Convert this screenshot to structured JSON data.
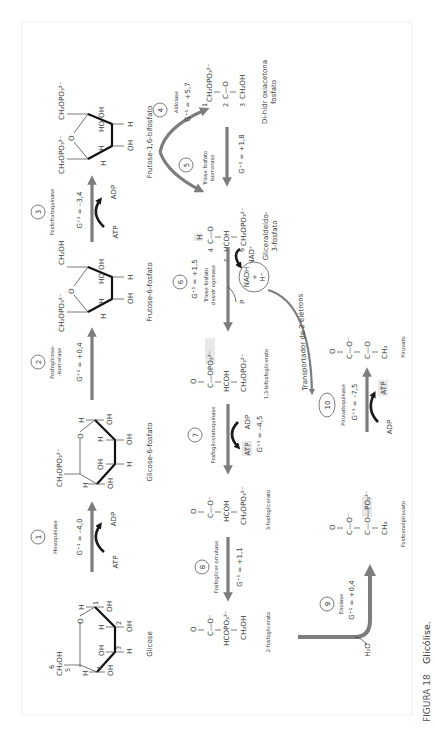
{
  "figure": {
    "caption_number": "FIGURA 18",
    "caption_title": "Glicólise.",
    "orientation": "rotated 90° counter-clockwise"
  },
  "colors": {
    "main_arrow": "#7d7d7d",
    "cofactor_arrow": "#1a1a1a",
    "text": "#3a3a3a",
    "frame_border": "#f0f0f0"
  },
  "steps": [
    {
      "number": "1",
      "enzyme": "Hexoquinase",
      "dg": "G⁺¹ = –4,0",
      "cofactor_in": "ATP",
      "cofactor_out": "ADP"
    },
    {
      "number": "2",
      "enzyme_line1": "Fosfoglicose-",
      "enzyme_line2": "-isomerase",
      "dg": "G⁺¹ = +0,4"
    },
    {
      "number": "3",
      "enzyme": "Fosfofrutoquinase",
      "dg": "G⁺¹ = –3,4",
      "cofactor_in": "ATP",
      "cofactor_out": "ADP"
    },
    {
      "number": "4",
      "enzyme": "Aldolase",
      "dg": "G⁺¹ = +5,7"
    },
    {
      "number": "5",
      "enzyme_line1": "Triose fosfato",
      "enzyme_line2": "isomerase",
      "dg": "G⁺¹ = +1,8"
    },
    {
      "number": "6",
      "enzyme_line1": "Triose fosfato",
      "enzyme_line2": "desidr ogenase",
      "dg": "G⁺¹ = +1,5",
      "cofactor_in": "NAD⁺",
      "phosphate": "P",
      "product_circle": [
        "NADH",
        "+",
        "H⁺"
      ]
    },
    {
      "number": "7",
      "enzyme": "Fosfogliceratoquinase",
      "dg": "G⁺¹ = –4,5",
      "cofactor_in": "ADP",
      "cofactor_out": "ATP"
    },
    {
      "number": "8",
      "enzyme": "Fosfoglicer omutase",
      "dg": "G⁺¹ = +1,1"
    },
    {
      "number": "9",
      "enzyme": "Enolase",
      "dg": "G⁺¹ = +0,4",
      "byproduct": "H₂O"
    },
    {
      "number": "10",
      "enzyme": "Piruvatoquinase",
      "dg": "G⁺¹ = –7,5",
      "cofactor_in": "ADP",
      "cofactor_out": "ATP"
    }
  ],
  "compounds": {
    "glicose": {
      "name": "Glicose",
      "top": "CH₂OH",
      "carbon6": "6",
      "carbon5": "5",
      "carbon4": "4",
      "carbon3": "3",
      "carbon2": "2",
      "carbon1": "1"
    },
    "glicose6p": {
      "name": "Glicose-6-fosfato",
      "top": "CH₂OPO₃²⁻"
    },
    "frutose6p": {
      "name": "Frutose-6-fosfato",
      "left": "CH₂OPO₃²⁻",
      "right": "CH₂OH"
    },
    "frutose16bp": {
      "name": "Frutose-1,6-bifosfato",
      "left": "CH₂OPO₃²⁻",
      "right": "CH₂OPO₃²⁻"
    },
    "dhap": {
      "name_line1": "Di-hidr oxiacetona",
      "name_line2": "fosfato",
      "l1": "CH₂OPO₃²⁻",
      "l2": "C—O",
      "l3": "CH₂OH"
    },
    "g3p": {
      "name_line1": "Gliceraldeído-",
      "name_line2": "3-fosfato",
      "l0": "H",
      "l1": "C—O",
      "l2": "HCOH",
      "l3": "CH₂OPO₃²⁻"
    },
    "bpg13": {
      "name": "1,3-bifosfoglicerato",
      "l0": "O",
      "l1": "C—OPO₃²⁻",
      "l2": "HCOH",
      "l3": "CH₂OPO₃²⁻"
    },
    "pg3": {
      "name": "3-fosfoglicerato",
      "l0": "O",
      "l1": "C—O⁻",
      "l2": "HCOH",
      "l3": "CH₂OPO₃²⁻"
    },
    "pg2": {
      "name": "2-fosfoglicerato",
      "l0": "O",
      "l1": "C—O⁻",
      "l2": "HCOPO₃²⁻",
      "l3": "CH₂OH"
    },
    "pep": {
      "name": "Fosfoenolpiruvato",
      "l0": "O",
      "l1": "C—O⁻",
      "l2": "C—O—PO₃²⁻",
      "l3": "CH₂"
    },
    "piruvato": {
      "name": "Piruvato",
      "l0": "O",
      "l1": "C—O⁻",
      "l2": "C—O",
      "l3": "CH₃"
    }
  },
  "electron_carrier_label": "Transportador de 2 elétrons",
  "ring_labels": {
    "H": "H",
    "OH": "OH",
    "HO": "HO",
    "O": "O"
  }
}
